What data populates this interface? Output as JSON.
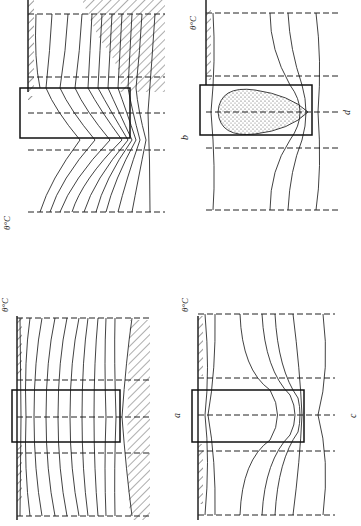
{
  "figure": {
    "panels": [
      {
        "id": "b",
        "label": "b",
        "axis_label": "θ°C",
        "top_labels": [
          "3",
          "2",
          "1",
          "0",
          "-1",
          "-2",
          "-3",
          "-4",
          "-5",
          "-6",
          "-7",
          "-8",
          "-9"
        ],
        "bottom_labels": [
          "14",
          "12",
          "10",
          "8",
          "6",
          "4",
          "2",
          "0",
          "-2",
          "-4",
          "-5",
          "-7"
        ],
        "side_labels": [
          "15°",
          "15°14°",
          "12°10°8°7°6°",
          "5°4°"
        ],
        "shaded_region": "hatched",
        "body": "rectangle"
      },
      {
        "id": "d",
        "label": "d",
        "axis_label": "θ°C",
        "top_labels": [
          "1",
          "-1",
          "-2",
          "-3"
        ],
        "bottom_labels": [
          "1°C",
          "-1",
          "-2",
          "-3"
        ],
        "body": "rectangle with stippled ellipse"
      },
      {
        "id": "a",
        "label": "a",
        "axis_label": "θ°C",
        "top_labels": [
          "10",
          "9",
          "8",
          "7",
          "6",
          "5",
          "4",
          "3",
          "2",
          "1",
          "0"
        ],
        "bottom_labels": [
          "10",
          "9",
          "8",
          "7",
          "6",
          "5",
          "4",
          "3",
          "2",
          "1",
          "0"
        ],
        "side_labels": [
          "11°",
          "11°"
        ],
        "body": "rectangle"
      },
      {
        "id": "c",
        "label": "c",
        "axis_label": "θ°C",
        "top_labels": [
          "1",
          "0",
          "0",
          "-1",
          "-2",
          "-3",
          "-4"
        ],
        "bottom_labels": [
          "1",
          "0",
          "0",
          "-1",
          "-2",
          "-3",
          "-4"
        ],
        "body": "rectangle"
      }
    ]
  }
}
